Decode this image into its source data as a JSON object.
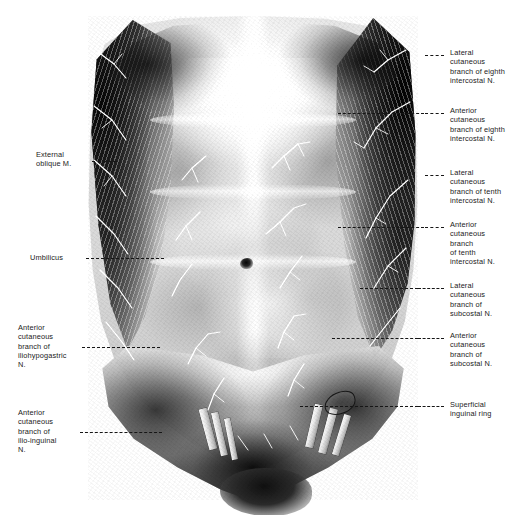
{
  "plate": {
    "title": "Anterior abdominal wall — cutaneous nerves",
    "background_color": "#ffffff",
    "ink_color": "#1b1b1b",
    "width": 531,
    "height": 515
  },
  "specimen": {
    "name": "anterior-abdominal-wall-dissection",
    "rendering": "greyscale halftone photograph"
  },
  "labels": {
    "right": [
      {
        "id": "lateral-cutaneous-branch-eighth-intercostal",
        "text": "Lateral\ncutaneous\nbranch of eighth\nintercostal N.",
        "leader": {
          "x1": 425,
          "x2": 444,
          "y": 55
        },
        "text_x": 450,
        "text_y": 48
      },
      {
        "id": "anterior-cutaneous-branch-eighth-intercostal",
        "text": "Anterior\ncutaneous\nbranch of eighth\nintercostal N.",
        "leader": {
          "x1": 425,
          "x2": 444,
          "y": 113
        },
        "text_x": 450,
        "text_y": 106
      },
      {
        "id": "lateral-cutaneous-branch-tenth-intercostal",
        "text": "Lateral\ncutaneous\nbranch of tenth\nintercostal N.",
        "leader": {
          "x1": 425,
          "x2": 444,
          "y": 175
        },
        "text_x": 450,
        "text_y": 168
      },
      {
        "id": "anterior-cutaneous-branch-tenth-intercostal",
        "text": "Anterior\ncutaneous\nbranch\nof tenth\nintercostal N.",
        "leader": {
          "x1": 425,
          "x2": 444,
          "y": 227
        },
        "text_x": 450,
        "text_y": 220
      },
      {
        "id": "lateral-cutaneous-branch-subcostal",
        "text": "Lateral\ncutaneous\nbranch of\nsubcostal N.",
        "leader": {
          "x1": 420,
          "x2": 444,
          "y": 288
        },
        "text_x": 450,
        "text_y": 281
      },
      {
        "id": "anterior-cutaneous-branch-subcostal",
        "text": "Anterior\ncutaneous\nbranch of\nsubcostal N.",
        "leader": {
          "x1": 420,
          "x2": 444,
          "y": 338
        },
        "text_x": 450,
        "text_y": 331
      },
      {
        "id": "superficial-inguinal-ring",
        "text": "Superficial\ninguinal ring",
        "leader": {
          "x1": 420,
          "x2": 444,
          "y": 406
        },
        "text_x": 450,
        "text_y": 400
      }
    ],
    "left": [
      {
        "id": "external-oblique-muscle",
        "text": "External\noblique M.",
        "leader": {
          "x1": 92,
          "x2": 117,
          "y": 161
        },
        "text_x": 36,
        "text_y": 150,
        "text_width": 54
      },
      {
        "id": "umbilicus",
        "text": "Umbilicus",
        "leader": {
          "x1": 86,
          "x2": 130,
          "y": 258
        },
        "text_x": 30,
        "text_y": 253,
        "text_width": 52
      },
      {
        "id": "anterior-cutaneous-branch-iliohypogastric",
        "text": "Anterior\ncutaneous\nbranch of\niliohypogastric\nN.",
        "leader": {
          "x1": 82,
          "x2": 132,
          "y": 347
        },
        "text_x": 18,
        "text_y": 323,
        "text_width": 62
      },
      {
        "id": "anterior-cutaneous-branch-ilio-inguinal",
        "text": "Anterior\ncutaneous\nbranch of\nilio-inguinal\nN.",
        "leader": {
          "x1": 80,
          "x2": 140,
          "y": 432
        },
        "text_x": 18,
        "text_y": 408,
        "text_width": 58
      }
    ]
  }
}
